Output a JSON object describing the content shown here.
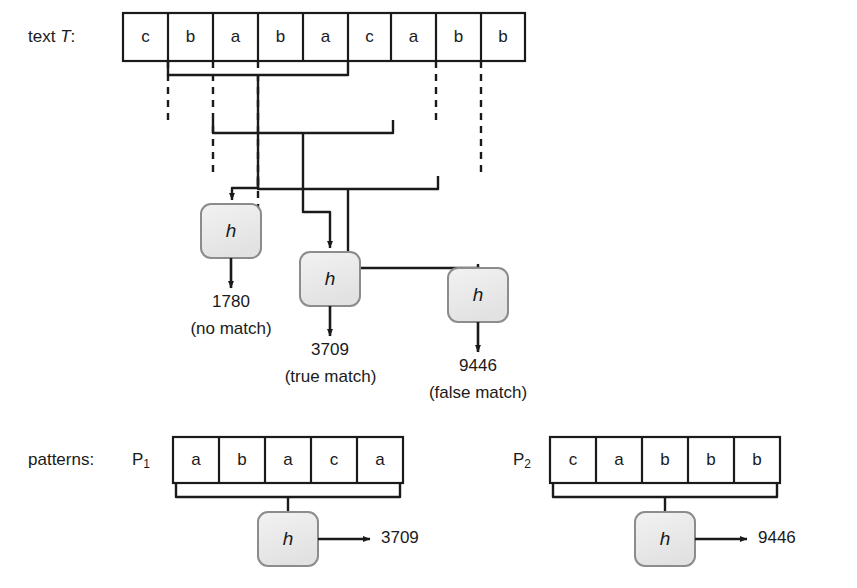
{
  "figure": {
    "colors": {
      "ink": "#1a1a1a",
      "box_fill": "#e9e9e9",
      "box_stroke": "#8c8c8c",
      "background": "#ffffff"
    }
  },
  "text_row": {
    "label_prefix": "text ",
    "label_symbol": "T",
    "label_suffix": ":",
    "cells": [
      "c",
      "b",
      "a",
      "b",
      "a",
      "c",
      "a",
      "b",
      "b"
    ]
  },
  "hashes": [
    {
      "id": "hash-1",
      "glyph": "h",
      "value": "1780",
      "note": "(no match)",
      "source_span": [
        1,
        5
      ]
    },
    {
      "id": "hash-2",
      "glyph": "h",
      "value": "3709",
      "note": "(true match)",
      "source_span": [
        2,
        6
      ]
    },
    {
      "id": "hash-3",
      "glyph": "h",
      "value": "9446",
      "note": "(false match)",
      "source_span": [
        3,
        7
      ]
    }
  ],
  "patterns_row": {
    "label": "patterns:",
    "patterns": [
      {
        "id": "pattern-1",
        "name": "P",
        "subscript": "1",
        "cells": [
          "a",
          "b",
          "a",
          "c",
          "a"
        ],
        "hash_glyph": "h",
        "hash_value": "3709"
      },
      {
        "id": "pattern-2",
        "name": "P",
        "subscript": "2",
        "cells": [
          "c",
          "a",
          "b",
          "b",
          "b"
        ],
        "hash_glyph": "h",
        "hash_value": "9446"
      }
    ]
  }
}
